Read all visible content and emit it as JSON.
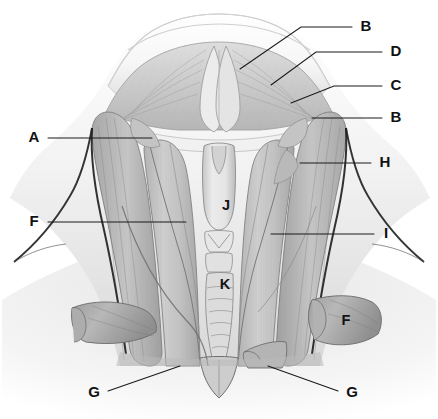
{
  "figure": {
    "background_color": "#ffffff",
    "ink_color": "#1a1a1a",
    "style": "grayscale medical illustration"
  },
  "labels": [
    {
      "id": "label-b-top",
      "text": "B",
      "x": 366,
      "y": 27,
      "anchor": "right",
      "leader": [
        [
          352,
          27
        ],
        [
          301,
          27
        ],
        [
          240,
          69
        ]
      ]
    },
    {
      "id": "label-d",
      "text": "D",
      "x": 396,
      "y": 52,
      "anchor": "right",
      "leader": [
        [
          382,
          52
        ],
        [
          316,
          52
        ],
        [
          271,
          85
        ]
      ]
    },
    {
      "id": "label-c",
      "text": "C",
      "x": 396,
      "y": 86,
      "anchor": "right",
      "leader": [
        [
          382,
          86
        ],
        [
          334,
          86
        ],
        [
          291,
          103
        ]
      ]
    },
    {
      "id": "label-b-right",
      "text": "B",
      "x": 396,
      "y": 118,
      "anchor": "right",
      "leader": [
        [
          382,
          118
        ],
        [
          312,
          118
        ]
      ]
    },
    {
      "id": "label-h",
      "text": "H",
      "x": 385,
      "y": 163,
      "anchor": "right",
      "leader": [
        [
          371,
          163
        ],
        [
          300,
          163
        ]
      ]
    },
    {
      "id": "label-i",
      "text": "I",
      "x": 386,
      "y": 234,
      "anchor": "right",
      "leader": [
        [
          374,
          234
        ],
        [
          271,
          234
        ]
      ]
    },
    {
      "id": "label-a",
      "text": "A",
      "x": 34,
      "y": 138,
      "anchor": "left",
      "leader": [
        [
          48,
          138
        ],
        [
          152,
          138
        ]
      ]
    },
    {
      "id": "label-f-left",
      "text": "F",
      "x": 34,
      "y": 222,
      "anchor": "left",
      "leader": [
        [
          48,
          222
        ],
        [
          186,
          222
        ]
      ]
    },
    {
      "id": "label-g-left",
      "text": "G",
      "x": 94,
      "y": 393,
      "anchor": "left",
      "leader": [
        [
          108,
          391
        ],
        [
          180,
          366
        ]
      ]
    },
    {
      "id": "label-g-right",
      "text": "G",
      "x": 352,
      "y": 393,
      "anchor": "right",
      "leader": [
        [
          338,
          391
        ],
        [
          268,
          366
        ]
      ]
    },
    {
      "id": "label-f-figure",
      "text": "F",
      "x": 346,
      "y": 321,
      "anchor": "none",
      "leader": []
    },
    {
      "id": "label-j",
      "text": "J",
      "x": 226,
      "y": 206,
      "anchor": "none",
      "leader": []
    },
    {
      "id": "label-k",
      "text": "K",
      "x": 225,
      "y": 285,
      "anchor": "none",
      "leader": []
    }
  ],
  "legend_letters": [
    "A",
    "B",
    "C",
    "D",
    "F",
    "G",
    "H",
    "I",
    "J",
    "K"
  ]
}
